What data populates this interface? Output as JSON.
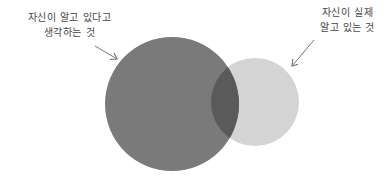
{
  "labels": {
    "think_know": {
      "line1": "자신이 알고 있다고",
      "line2": "생각하는 것"
    },
    "actually_know": {
      "line1": "자신이 실제",
      "line2": "알고 있는 것"
    }
  },
  "colors": {
    "large_circle": "#7a7a7a",
    "small_circle": "#d4d4d4",
    "overlap": "#5f5f5f",
    "arrow": "#777777"
  }
}
